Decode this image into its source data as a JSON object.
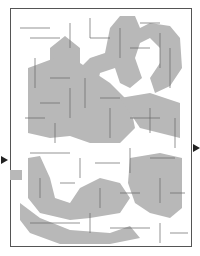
{
  "maze": {
    "type": "rectangular-maze",
    "shading_color": "#b4b4b4",
    "wall_color": "#555555",
    "background_color": "#ffffff",
    "entrance": {
      "side": "left",
      "icon": "arrow-right-icon"
    },
    "exit": {
      "side": "right",
      "icon": "arrow-right-icon"
    },
    "hidden_picture": "shaded regions forming a figure (apple/pumpkin-like shapes)"
  }
}
